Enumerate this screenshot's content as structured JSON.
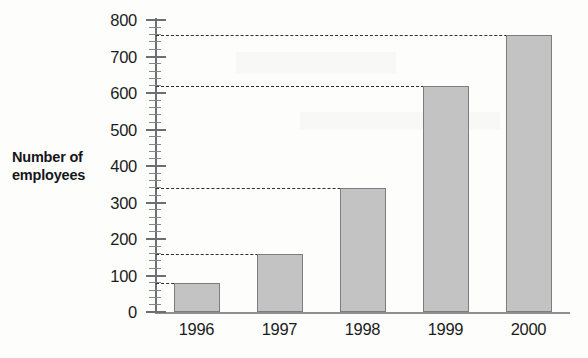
{
  "chart_data": {
    "type": "bar",
    "title": "",
    "xlabel": "",
    "ylabel": "Number of employees",
    "ylabel_line1": "Number of",
    "ylabel_line2": "employees",
    "categories": [
      "1996",
      "1997",
      "1998",
      "1999",
      "2000"
    ],
    "values": [
      80,
      160,
      340,
      620,
      760
    ],
    "series": [
      {
        "name": "Number of employees",
        "values": [
          80,
          160,
          340,
          620,
          760
        ]
      }
    ],
    "ylim": [
      0,
      800
    ],
    "y_major_ticks": [
      0,
      100,
      200,
      300,
      400,
      500,
      600,
      700,
      800
    ],
    "y_tick_labels": [
      "0",
      "100",
      "200",
      "300",
      "400",
      "500",
      "600",
      "700",
      "800"
    ],
    "y_minor_tick_interval": 20,
    "grid": "dashed-value-guides",
    "guides": [
      80,
      160,
      340,
      620,
      760
    ],
    "legend": "none",
    "legend_position": "none",
    "bar_fill_color": "#c3c3c3",
    "bar_border_color": "#7b7d80",
    "axis_color": "#6c6e71",
    "guide_color": "#2e2f33",
    "background_color": "#fdfdfc",
    "text_color": "#1b1c20"
  }
}
